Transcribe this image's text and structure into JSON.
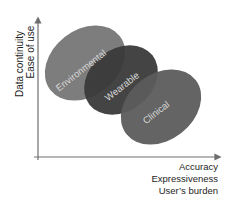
{
  "diagram": {
    "y_axis": {
      "labels": [
        "Data continuity",
        "Ease of use"
      ]
    },
    "x_axis": {
      "labels": [
        "Accuracy",
        "Expressiveness",
        "User’s burden"
      ]
    },
    "regions": [
      {
        "name": "Environmental",
        "color": "#7d7d7d"
      },
      {
        "name": "Wearable",
        "color": "#3a3a3a"
      },
      {
        "name": "Clinical",
        "color": "#5c5c5c"
      }
    ]
  }
}
